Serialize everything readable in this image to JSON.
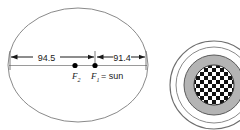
{
  "figure": {
    "type": "geometry-diagram",
    "ellipse": {
      "name": "orbit-ellipse",
      "stroke": "#8a8a8a",
      "fill": "#ffffff"
    },
    "major_axis": {
      "name": "major-axis-line",
      "stroke": "#9a9a9a"
    },
    "dimensions": [
      {
        "label": "94.5",
        "from": "left-vertex",
        "to": "F2-right-of-center",
        "name": "dimension-94-5"
      },
      {
        "label": "91.4",
        "from": "F1",
        "to": "right-vertex",
        "name": "dimension-91-4"
      }
    ],
    "foci": [
      {
        "label": "F",
        "subscript": "2",
        "annotation": "",
        "name": "focus-f2"
      },
      {
        "label": "F",
        "subscript": "1",
        "annotation": "= sun",
        "name": "focus-f1"
      }
    ],
    "secondary_figure": {
      "name": "concentric-disc-figure",
      "description": "concentric circles with checkered center",
      "rings": [
        {
          "name": "outer-ring",
          "fill": "#ffffff",
          "stroke": "#6e6e6e"
        },
        {
          "name": "middle-ring",
          "fill": "#b4b4b4",
          "stroke": "#5a5a5a"
        },
        {
          "name": "checker-core",
          "fill": "checkerboard",
          "stroke": "#333333"
        }
      ],
      "checker_colors": {
        "light": "#ffffff",
        "dark": "#111111"
      }
    },
    "colors": {
      "line": "#8a8a8a",
      "text": "#1a1a1a",
      "dot": "#000000",
      "gray_fill": "#b4b4b4"
    }
  }
}
